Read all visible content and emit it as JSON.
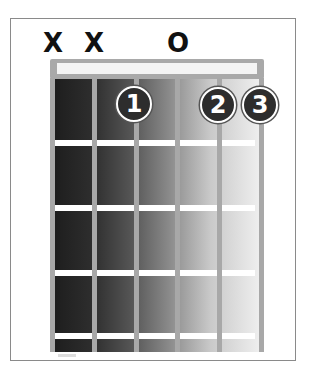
{
  "chord_diagram": {
    "type": "guitar-chord",
    "string_markers": [
      {
        "string": 6,
        "label": "X",
        "meaning": "muted"
      },
      {
        "string": 5,
        "label": "X",
        "meaning": "muted"
      },
      {
        "string": 4,
        "label": "",
        "meaning": ""
      },
      {
        "string": 3,
        "label": "O",
        "meaning": "open"
      },
      {
        "string": 2,
        "label": "",
        "meaning": ""
      },
      {
        "string": 1,
        "label": "",
        "meaning": ""
      }
    ],
    "strings": 6,
    "frets_shown": 4,
    "finger_positions": [
      {
        "string": 4,
        "fret": 1,
        "finger": "1"
      },
      {
        "string": 2,
        "fret": 1,
        "finger": "2"
      },
      {
        "string": 1,
        "fret": 1,
        "finger": "3"
      }
    ]
  }
}
